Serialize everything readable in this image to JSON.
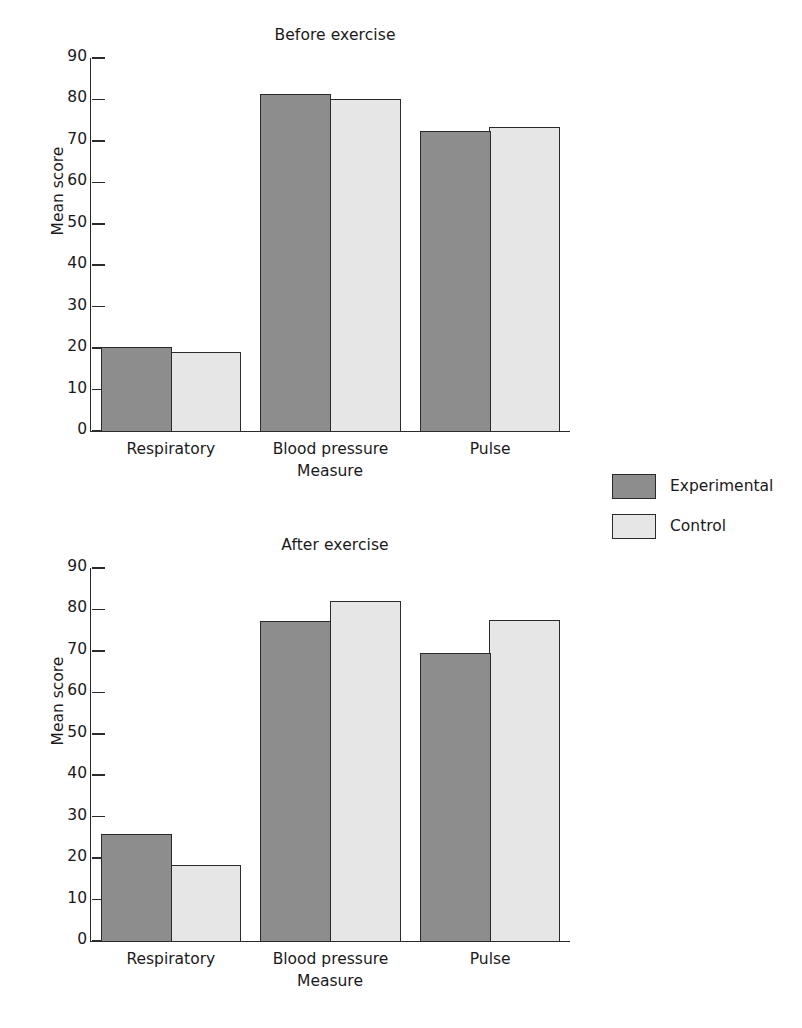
{
  "colors": {
    "experimental": "#8d8d8d",
    "control": "#e6e6e6",
    "axis": "#2b2b2b",
    "background": "#ffffff"
  },
  "legend": {
    "items": [
      {
        "label": "Experimental",
        "swatch": "#8d8d8d"
      },
      {
        "label": "Control",
        "swatch": "#e6e6e6"
      }
    ]
  },
  "axis": {
    "ticks": [
      "90",
      "80",
      "70",
      "60",
      "50",
      "40",
      "30",
      "20",
      "10",
      "0"
    ],
    "ylabel": "Mean score",
    "xlabel": "Measure"
  },
  "charts": [
    {
      "title": "Before exercise",
      "ylabel": "Mean score",
      "xlabel": "Measure",
      "categories": [
        "Respiratory",
        "Blood pressure",
        "Pulse"
      ]
    },
    {
      "title": "After exercise",
      "ylabel": "Mean score",
      "xlabel": "Measure",
      "categories": [
        "Respiratory",
        "Blood pressure",
        "Pulse"
      ]
    }
  ],
  "chart_data": [
    {
      "type": "bar",
      "title": "Before exercise",
      "xlabel": "Measure",
      "ylabel": "Mean score",
      "categories": [
        "Respiratory",
        "Blood pressure",
        "Pulse"
      ],
      "series": [
        {
          "name": "Experimental",
          "values": [
            20.3,
            81.4,
            72.5
          ],
          "color": "#8d8d8d"
        },
        {
          "name": "Control",
          "values": [
            19.0,
            80.0,
            73.4
          ],
          "color": "#e6e6e6"
        }
      ],
      "ylim": [
        0,
        90
      ],
      "ytick_step": 10,
      "grid": false,
      "legend_position": "right"
    },
    {
      "type": "bar",
      "title": "After exercise",
      "xlabel": "Measure",
      "ylabel": "Mean score",
      "categories": [
        "Respiratory",
        "Blood pressure",
        "Pulse"
      ],
      "series": [
        {
          "name": "Experimental",
          "values": [
            25.8,
            77.3,
            69.5
          ],
          "color": "#8d8d8d"
        },
        {
          "name": "Control",
          "values": [
            18.4,
            82.0,
            77.5
          ],
          "color": "#e6e6e6"
        }
      ],
      "ylim": [
        0,
        90
      ],
      "ytick_step": 10,
      "grid": false,
      "legend_position": "right"
    }
  ]
}
